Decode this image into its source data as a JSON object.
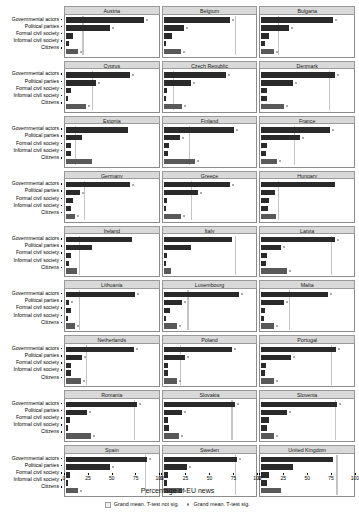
{
  "title_cut": "Figure",
  "axis": {
    "xlabel": "Percentage of EU news",
    "ticks": [
      0,
      25,
      50,
      75,
      100
    ],
    "xmin": 0,
    "xmax": 100
  },
  "categories": [
    "Governmental actors",
    "Political parties",
    "Formal civil society",
    "Informal civil society",
    "Citizens"
  ],
  "legend": {
    "position": "bottom",
    "items": [
      {
        "label": "Grand mean. T-test not sig.",
        "marker": "box",
        "color": "#f2f2f2"
      },
      {
        "label": "Grand mean. T-test sig.",
        "marker": "dot",
        "color": "#c9c9c9"
      }
    ]
  },
  "colors": {
    "bar": "#2a2a2a",
    "bar_citizens": "#595959",
    "strip": "#d9d9d9",
    "grand_mean": "#bdbdbd"
  },
  "chart_data": {
    "type": "bar",
    "xlabel": "Percentage of EU news",
    "ylabel": "",
    "xlim": [
      0,
      100
    ],
    "grid": false,
    "orientation": "horizontal",
    "facet_by": "country",
    "categories": [
      "Governmental actors",
      "Political parties",
      "Formal civil society",
      "Informal civil society",
      "Citizens"
    ],
    "panels": [
      {
        "country": "Austria",
        "values": [
          85,
          48,
          8,
          3,
          13
        ],
        "grand_mean": 18,
        "grand_mean_sig": true
      },
      {
        "country": "Belgium",
        "values": [
          72,
          22,
          9,
          3,
          19
        ],
        "grand_mean": 78,
        "grand_mean_sig": true
      },
      {
        "country": "Bulgaria",
        "values": [
          78,
          30,
          8,
          4,
          14
        ],
        "grand_mean": 18,
        "grand_mean_sig": true
      },
      {
        "country": "Cyprus",
        "values": [
          70,
          33,
          5,
          2,
          22
        ],
        "grand_mean": 28,
        "grand_mean_sig": true
      },
      {
        "country": "Czech Republic",
        "values": [
          68,
          30,
          4,
          3,
          20
        ],
        "grand_mean": 10,
        "grand_mean_sig": true
      },
      {
        "country": "Denmark",
        "values": [
          80,
          35,
          6,
          6,
          25
        ],
        "grand_mean": 74,
        "grand_mean_sig": true
      },
      {
        "country": "Estonia",
        "values": [
          68,
          18,
          5,
          5,
          28
        ],
        "grand_mean": 10,
        "grand_mean_sig": false
      },
      {
        "country": "Finland",
        "values": [
          77,
          18,
          6,
          5,
          34
        ],
        "grand_mean": 28,
        "grand_mean_sig": true
      },
      {
        "country": "France",
        "values": [
          75,
          42,
          6,
          5,
          17
        ],
        "grand_mean": 36,
        "grand_mean_sig": true
      },
      {
        "country": "Germany",
        "values": [
          70,
          15,
          8,
          6,
          10
        ],
        "grand_mean": 20,
        "grand_mean_sig": true
      },
      {
        "country": "Greece",
        "values": [
          72,
          37,
          4,
          3,
          19
        ],
        "grand_mean": 30,
        "grand_mean_sig": true
      },
      {
        "country": "Hungary",
        "values": [
          80,
          15,
          8,
          7,
          16
        ],
        "grand_mean": 18,
        "grand_mean_sig": false
      },
      {
        "country": "Ireland",
        "values": [
          72,
          28,
          6,
          3,
          12
        ],
        "grand_mean": 14,
        "grand_mean_sig": false
      },
      {
        "country": "Italy",
        "values": [
          75,
          30,
          4,
          3,
          8
        ],
        "grand_mean": 78,
        "grand_mean_sig": false
      },
      {
        "country": "Latvia",
        "values": [
          80,
          22,
          6,
          5,
          28
        ],
        "grand_mean": 76,
        "grand_mean_sig": true
      },
      {
        "country": "Lithuania",
        "values": [
          75,
          3,
          5,
          2,
          10
        ],
        "grand_mean": 14,
        "grand_mean_sig": true
      },
      {
        "country": "Luxembourg",
        "values": [
          82,
          20,
          7,
          3,
          15
        ],
        "grand_mean": 26,
        "grand_mean_sig": true
      },
      {
        "country": "Malta",
        "values": [
          73,
          25,
          4,
          3,
          14
        ],
        "grand_mean": 30,
        "grand_mean_sig": true
      },
      {
        "country": "Netherlands",
        "values": [
          74,
          17,
          6,
          5,
          16
        ],
        "grand_mean": 22,
        "grand_mean_sig": true
      },
      {
        "country": "Poland",
        "values": [
          75,
          23,
          5,
          5,
          15
        ],
        "grand_mean": 18,
        "grand_mean_sig": true
      },
      {
        "country": "Portugal",
        "values": [
          82,
          32,
          5,
          4,
          14
        ],
        "grand_mean": 76,
        "grand_mean_sig": true
      },
      {
        "country": "Romania",
        "values": [
          78,
          23,
          4,
          2,
          27
        ],
        "grand_mean": 74,
        "grand_mean_sig": true
      },
      {
        "country": "Slovakia",
        "values": [
          78,
          20,
          5,
          6,
          17
        ],
        "grand_mean": 74,
        "grand_mean_sig": true
      },
      {
        "country": "Slovenia",
        "values": [
          83,
          28,
          8,
          6,
          14
        ],
        "grand_mean": 80,
        "grand_mean_sig": true
      },
      {
        "country": "Spain",
        "values": [
          88,
          48,
          4,
          2,
          13
        ],
        "grand_mean": 86,
        "grand_mean_sig": true
      },
      {
        "country": "Sweden",
        "values": [
          80,
          25,
          5,
          4,
          20
        ],
        "grand_mean": 78,
        "grand_mean_sig": true
      },
      {
        "country": "United Kingdom",
        "values": [
          78,
          35,
          8,
          6,
          22
        ],
        "grand_mean": 82,
        "grand_mean_sig": false
      }
    ]
  }
}
